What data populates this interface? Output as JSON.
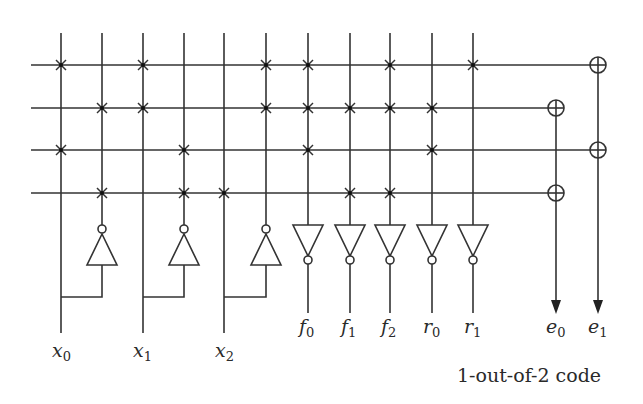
{
  "diagram": {
    "caption": "1-out-of-2 code",
    "columns": [
      {
        "id": "x0",
        "x": 61,
        "kind": "input",
        "label": "x",
        "sub": "0"
      },
      {
        "id": "x0n",
        "x": 102,
        "kind": "input-complement",
        "of": "x0"
      },
      {
        "id": "x1",
        "x": 143,
        "kind": "input",
        "label": "x",
        "sub": "1"
      },
      {
        "id": "x1n",
        "x": 184,
        "kind": "input-complement",
        "of": "x1"
      },
      {
        "id": "x2",
        "x": 224,
        "kind": "input",
        "label": "x",
        "sub": "2"
      },
      {
        "id": "x2n",
        "x": 266,
        "kind": "input-complement",
        "of": "x2"
      },
      {
        "id": "f0",
        "x": 308,
        "kind": "output",
        "label": "f",
        "sub": "0"
      },
      {
        "id": "f1",
        "x": 350,
        "kind": "output",
        "label": "f",
        "sub": "1"
      },
      {
        "id": "f2",
        "x": 390,
        "kind": "output",
        "label": "f",
        "sub": "2"
      },
      {
        "id": "r0",
        "x": 432,
        "kind": "output",
        "label": "r",
        "sub": "0"
      },
      {
        "id": "r1",
        "x": 473,
        "kind": "output",
        "label": "r",
        "sub": "1"
      }
    ],
    "rows_y": [
      65,
      108,
      150,
      193
    ],
    "crosspoints": [
      [
        61,
        143,
        266,
        308,
        390,
        473
      ],
      [
        102,
        143,
        266,
        308,
        350,
        390,
        432
      ],
      [
        61,
        184,
        308,
        432
      ],
      [
        102,
        184,
        224,
        350,
        390
      ]
    ],
    "xor_gates": [
      {
        "row": 0,
        "col": "e1"
      },
      {
        "row": 1,
        "col": "e0"
      },
      {
        "row": 2,
        "col": "e1"
      },
      {
        "row": 3,
        "col": "e0"
      }
    ],
    "error_outputs": [
      {
        "id": "e0",
        "x": 556,
        "label": "e",
        "sub": "0"
      },
      {
        "id": "e1",
        "x": 598,
        "label": "e",
        "sub": "1"
      }
    ],
    "labels": {
      "x0": {
        "main": "x",
        "sub": "0"
      },
      "x1": {
        "main": "x",
        "sub": "1"
      },
      "x2": {
        "main": "x",
        "sub": "2"
      },
      "f0": {
        "main": "f",
        "sub": "0"
      },
      "f1": {
        "main": "f",
        "sub": "1"
      },
      "f2": {
        "main": "f",
        "sub": "2"
      },
      "r0": {
        "main": "r",
        "sub": "0"
      },
      "r1": {
        "main": "r",
        "sub": "1"
      },
      "e0": {
        "main": "e",
        "sub": "0"
      },
      "e1": {
        "main": "e",
        "sub": "1"
      }
    },
    "colors": {
      "line": "#333333",
      "background": "#ffffff"
    }
  }
}
